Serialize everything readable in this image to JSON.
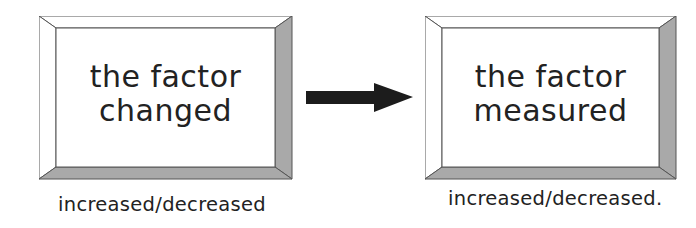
{
  "diagram": {
    "left_box": {
      "line1": "the factor",
      "line2": "changed",
      "caption": "increased/decreased"
    },
    "right_box": {
      "line1": "the factor",
      "line2": "measured",
      "caption": "increased/decreased."
    },
    "arrow": {
      "direction": "right",
      "icon": "arrow-right-icon"
    },
    "colors": {
      "bevel_dark": "#a9a9a9",
      "bevel_light": "#ffffff",
      "outline": "#555555",
      "arrow": "#1c1c1c",
      "text": "#222222"
    }
  }
}
